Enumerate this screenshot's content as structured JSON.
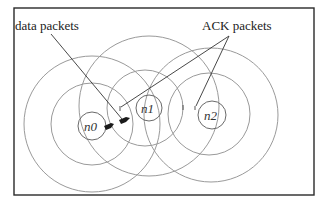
{
  "diagram": {
    "labels": {
      "data_packets": "data packets",
      "ack_packets": "ACK packets"
    },
    "nodes": [
      {
        "id": "n0",
        "label": "n0",
        "cx": 92,
        "cy": 126,
        "r_node": 14,
        "r_inner": 41,
        "r_outer": 68
      },
      {
        "id": "n1",
        "label": "n1",
        "cx": 149,
        "cy": 108,
        "r_node": 13,
        "r_inner": 38,
        "r_outer": 70
      },
      {
        "id": "n2",
        "label": "n2",
        "cx": 212,
        "cy": 115,
        "r_node": 14,
        "r_inner": 41,
        "r_outer": 67
      }
    ],
    "colors": {
      "frame": "#2a2a2a",
      "range_circle": "#9a9a9a",
      "packet": "#1a1a1a"
    }
  }
}
